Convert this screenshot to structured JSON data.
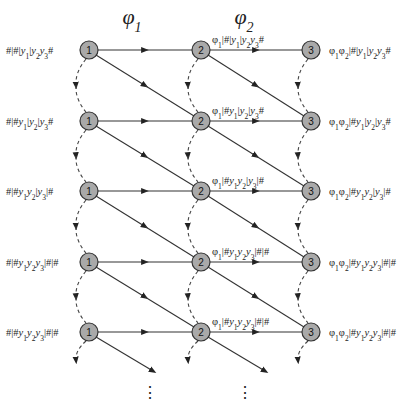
{
  "diagram": {
    "columns": [
      {
        "title": "φ1",
        "title_base": "φ",
        "title_sub": "1",
        "x": 89
      },
      {
        "title": "φ2",
        "title_base": "φ",
        "title_sub": "2",
        "x": 201
      },
      {
        "title": "",
        "x": 311
      }
    ],
    "rows_y": [
      50,
      121,
      191,
      262,
      332
    ],
    "node_labels": [
      "1",
      "2",
      "3"
    ],
    "node_radius": 9,
    "colors": {
      "node_fill": "#a9a9a9",
      "node_stroke": "#333333",
      "line": "#333333",
      "text": "#222222"
    },
    "left_labels": [
      "#|#|y1|y2y3#",
      "#|#y1|y2|y3#",
      "#|#y1y2|y3|#",
      "#|#y1y2y3|#|#",
      "#|#y1y2y3|#|#"
    ],
    "mid_labels": [
      "φ1|#|y1|y2y3#",
      "φ1|#y1|y2|y3#",
      "φ1|#y1y2|y3|#",
      "φ1|#y1y2y3|#|#",
      "φ1|#y1y2y3|#|#"
    ],
    "right_labels": [
      "φ1φ2|#|y1|y2y3#",
      "φ1φ2|#y1|y2|y3#",
      "φ1φ2|#y1y2|y3|#",
      "φ1φ2|#y1y2y3|#|#",
      "φ1φ2|#y1y2y3|#|#"
    ],
    "continuation": {
      "symbol": "⋮",
      "positions_x": [
        150,
        245
      ]
    }
  }
}
